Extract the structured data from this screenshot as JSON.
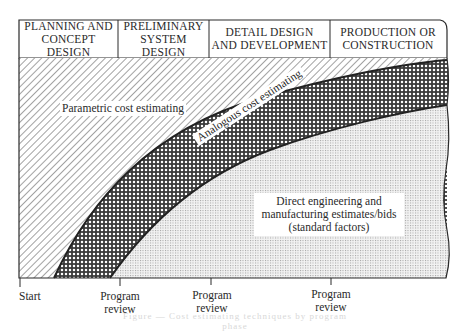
{
  "header": {
    "phases": [
      {
        "line1": "PLANNING AND",
        "line2": "CONCEPT DESIGN"
      },
      {
        "line1": "PRELIMINARY",
        "line2": "SYSTEM DESIGN"
      },
      {
        "line1": "DETAIL DESIGN",
        "line2": "AND DEVELOPMENT"
      },
      {
        "line1": "PRODUCTION OR",
        "line2": "CONSTRUCTION"
      }
    ]
  },
  "regions": {
    "parametric": "Parametric cost estimating",
    "analogous": "Analogous cost estimating",
    "direct": {
      "line1": "Direct engineering and",
      "line2": "manufacturing estimates/bids",
      "line3": "(standard factors)"
    }
  },
  "axis": {
    "start": "Start",
    "milestones": [
      {
        "line1": "Program",
        "line2": "review"
      },
      {
        "line1": "Program",
        "line2": "review"
      },
      {
        "line1": "Program",
        "line2": "review"
      }
    ]
  },
  "caption": "Figure — Cost estimating techniques by program phase",
  "colors": {
    "line": "#2a2a2a",
    "hatch": "#555555",
    "crosshatch": "#3a3a3a",
    "stipple": "#9a9a9a"
  }
}
